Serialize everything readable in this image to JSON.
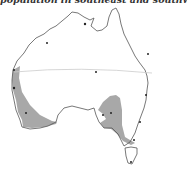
{
  "caption": "population in southeast and southwest",
  "map": {
    "subject": "Australia",
    "regions": [
      {
        "name": "southwest-population-zone",
        "fill": "#a8a8a8"
      },
      {
        "name": "southeast-population-zone",
        "fill": "#a8a8a8"
      }
    ],
    "line": {
      "name": "tropic-line",
      "color": "#cccccc"
    },
    "coast_color": "#555555",
    "city_marker_color": "#222222"
  }
}
